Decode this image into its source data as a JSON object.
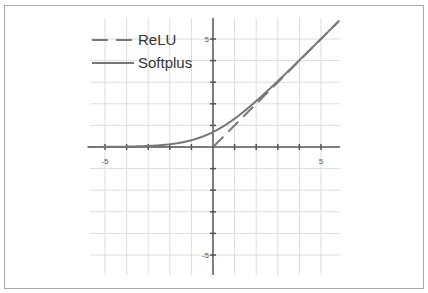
{
  "chart_data": {
    "type": "line",
    "title": "",
    "xlabel": "",
    "ylabel": "",
    "xlim": [
      -5.8,
      5.8
    ],
    "ylim": [
      -6,
      6
    ],
    "x_ticks": [
      -5,
      5
    ],
    "y_ticks": [
      5,
      -5
    ],
    "x_tick_labels": [
      "-5",
      "5"
    ],
    "y_tick_labels": [
      "5",
      "-5"
    ],
    "grid": true,
    "legend_position": "upper left",
    "series": [
      {
        "name": "ReLU",
        "style": "dashed",
        "color": "#777777",
        "formula": "max(0, x)",
        "x": [
          -5.8,
          -5,
          -4,
          -3,
          -2,
          -1,
          0,
          1,
          2,
          3,
          4,
          5,
          5.8
        ],
        "y": [
          0,
          0,
          0,
          0,
          0,
          0,
          0,
          1,
          2,
          3,
          4,
          5,
          5.8
        ]
      },
      {
        "name": "Softplus",
        "style": "solid",
        "color": "#777777",
        "formula": "ln(1 + e^x)",
        "x": [
          -5.8,
          -5,
          -4,
          -3,
          -2,
          -1,
          0,
          1,
          2,
          3,
          4,
          5,
          5.8
        ],
        "y": [
          0.003,
          0.0067,
          0.018,
          0.049,
          0.127,
          0.313,
          0.693,
          1.313,
          2.127,
          3.049,
          4.018,
          5.007,
          5.803
        ]
      }
    ]
  },
  "legend": {
    "items": [
      {
        "label": "ReLU"
      },
      {
        "label": "Softplus"
      }
    ]
  },
  "colors": {
    "grid": "#dcdcdc",
    "axis": "#555555",
    "curve": "#777777",
    "border": "#a8a8a8",
    "tick_label": "#555555"
  }
}
